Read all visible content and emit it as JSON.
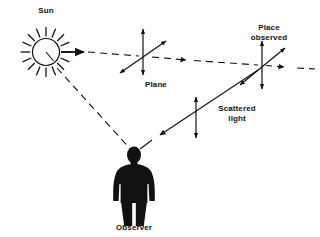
{
  "figure": {
    "width": 320,
    "height": 237,
    "background_color": "#ffffff",
    "ink_color": "#111111"
  },
  "labels": {
    "sun": "Sun",
    "plane": "Plane",
    "place_observed_line1": "Place",
    "place_observed_line2": "observed",
    "scattered_line1": "Scattered",
    "scattered_line2": "light",
    "observer": "Observer"
  },
  "elements": {
    "sun_symbol": "sun-with-rays",
    "observer_symbol": "standing-person-silhouette",
    "incident_ray_style": "dashed-with-arrowheads",
    "scattered_ray_style": "solid-with-arrowhead",
    "polarization_symbol": "double-headed-arrows"
  }
}
